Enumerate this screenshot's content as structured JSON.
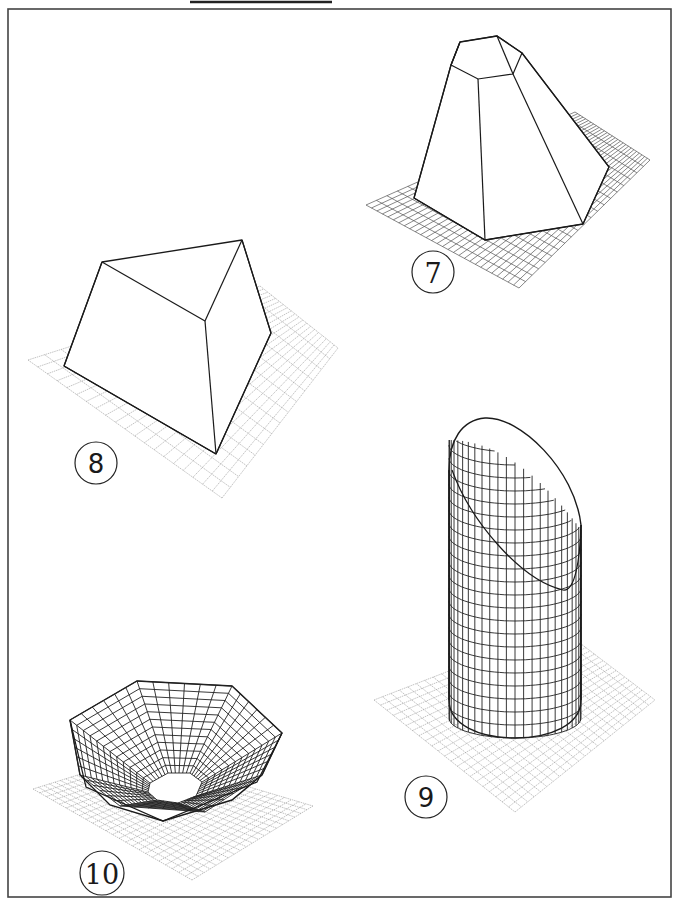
{
  "page": {
    "frame": {
      "x": 8,
      "y": 9,
      "width": 663,
      "height": 888,
      "stroke": "#444444"
    },
    "top_bar": {
      "x1": 190,
      "x2": 332,
      "y": 2
    }
  },
  "figures": [
    {
      "id": "7",
      "label": "7",
      "description": "hexagonal frustum (truncated pyramid) on grid",
      "label_circle": {
        "cx": 433,
        "cy": 272,
        "r": 21
      },
      "grid": {
        "style": "dark",
        "top": [
          575,
          112
        ],
        "right": [
          650,
          160
        ],
        "bottom": [
          519,
          288
        ],
        "left": [
          366,
          205
        ],
        "cells_a": 20,
        "cells_b": 28
      }
    },
    {
      "id": "8",
      "label": "8",
      "description": "triangular frustum (wedge) on grid",
      "label_circle": {
        "cx": 96,
        "cy": 463,
        "r": 21
      },
      "grid": {
        "style": "light",
        "top": [
          260,
          286
        ],
        "right": [
          338,
          348
        ],
        "bottom": [
          222,
          498
        ],
        "left": [
          28,
          360
        ],
        "cells_a": 14,
        "cells_b": 20
      }
    },
    {
      "id": "9",
      "label": "9",
      "description": "cylinder with slanted cut, mesh surface, on grid",
      "label_circle": {
        "cx": 426,
        "cy": 797,
        "r": 21
      },
      "grid": {
        "style": "light",
        "top": [
          560,
          628
        ],
        "right": [
          655,
          700
        ],
        "bottom": [
          515,
          812
        ],
        "left": [
          374,
          700
        ],
        "cells_a": 22,
        "cells_b": 22
      }
    },
    {
      "id": "10",
      "label": "10",
      "description": "inverted heptagonal bowl mesh on grid",
      "label_circle": {
        "cx": 102,
        "cy": 873,
        "r": 22
      },
      "grid": {
        "style": "light",
        "top": [
          142,
          755
        ],
        "right": [
          313,
          806
        ],
        "bottom": [
          192,
          880
        ],
        "left": [
          33,
          789
        ],
        "cells_a": 20,
        "cells_b": 24
      }
    }
  ]
}
